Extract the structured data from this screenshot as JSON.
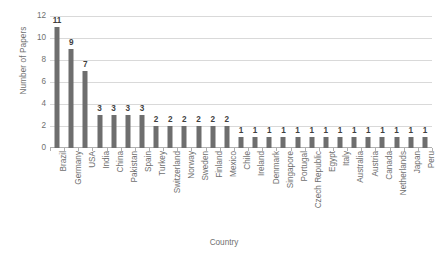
{
  "chart_data": {
    "type": "bar",
    "title": "",
    "xlabel": "Country",
    "ylabel": "Number of Papers",
    "ylim": [
      0,
      12
    ],
    "ytick_step": 2,
    "yticks": [
      0,
      2,
      4,
      6,
      8,
      10,
      12
    ],
    "grid": true,
    "legend": "none",
    "bar_color": "#6e6e6e",
    "gridline_color": "#d9d9d9",
    "axis_color": "#b0b0b0",
    "label_color": "#707070",
    "data_label_color": "#3f3f3f",
    "show_data_labels": true,
    "categories": [
      "Brazil",
      "Germany",
      "USA",
      "India",
      "China",
      "Pakistan",
      "Spain",
      "Turkey",
      "Switzerland",
      "Norway",
      "Sweden",
      "Finland",
      "Mexico",
      "Chile",
      "Ireland",
      "Denmark",
      "Singapore",
      "Portugal",
      "Czech Republic",
      "Egypt",
      "Italy",
      "Australia",
      "Austria",
      "Canada",
      "Netherlands",
      "Japan",
      "Peru"
    ],
    "values": [
      11,
      9,
      7,
      3,
      3,
      3,
      3,
      2,
      2,
      2,
      2,
      2,
      2,
      1,
      1,
      1,
      1,
      1,
      1,
      1,
      1,
      1,
      1,
      1,
      1,
      1,
      1
    ]
  }
}
